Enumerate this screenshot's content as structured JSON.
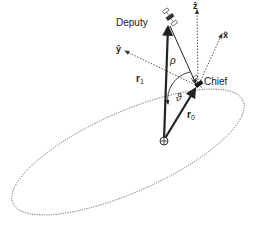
{
  "diagram": {
    "colors": {
      "line": "#222222",
      "orbit": "#555555",
      "axis": "#444444",
      "background": "#ffffff"
    },
    "labels": {
      "deputy": "Deputy",
      "chief": "Chief",
      "rho": "ρ",
      "r1": "r",
      "r1_sub": "1",
      "r0": "r",
      "r0_sub": "0",
      "theta": "ϑ",
      "x_axis": "x̂",
      "y_axis": "ŷ",
      "z_axis": "ẑ"
    },
    "nodes": [
      {
        "id": "deputy",
        "label": "Deputy",
        "x": 168,
        "y": 22,
        "icon": "satellite-icon"
      },
      {
        "id": "chief",
        "label": "Chief",
        "x": 198,
        "y": 86,
        "icon": "satellite-icon"
      },
      {
        "id": "earth",
        "label": "",
        "x": 164,
        "y": 140,
        "icon": "earth-center-icon"
      }
    ],
    "edges": [
      {
        "from": "earth",
        "to": "deputy",
        "label": "r1",
        "style": "solid-bold-arrow"
      },
      {
        "from": "earth",
        "to": "chief",
        "label": "r0",
        "style": "solid-bold-arrow"
      },
      {
        "from": "chief",
        "to": "deputy",
        "label": "rho",
        "style": "solid-arrow"
      },
      {
        "from": "chief",
        "to": "z_axis",
        "label": "z",
        "style": "dotted-arrow"
      },
      {
        "from": "chief",
        "to": "x_axis",
        "label": "x",
        "style": "dotted-arrow"
      },
      {
        "from": "chief",
        "to": "y_axis",
        "label": "y",
        "style": "dotted-arrow"
      }
    ],
    "orbit": {
      "shape": "ellipse",
      "style": "dotted"
    }
  }
}
